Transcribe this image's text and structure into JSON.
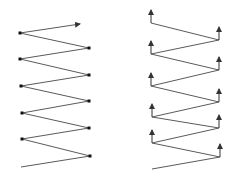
{
  "diagram": {
    "colors": {
      "line": "#5a5a5a",
      "point": "#111111",
      "arrow": "#333333",
      "background": "#ffffff"
    },
    "left_zigzag": {
      "description": "zigzag polyline with dot markers at vertices, arrow at top end",
      "points": [
        [
          80,
          24
        ],
        [
          20,
          33
        ],
        [
          89,
          48
        ],
        [
          20,
          59
        ],
        [
          89,
          75
        ],
        [
          21,
          86
        ],
        [
          89,
          101
        ],
        [
          22,
          113
        ],
        [
          89,
          128
        ],
        [
          22,
          139
        ],
        [
          90,
          156
        ],
        [
          21,
          167
        ]
      ],
      "dots": [
        [
          20,
          33
        ],
        [
          89,
          48
        ],
        [
          20,
          59
        ],
        [
          89,
          75
        ],
        [
          21,
          86
        ],
        [
          89,
          101
        ],
        [
          22,
          113
        ],
        [
          89,
          128
        ],
        [
          22,
          139
        ],
        [
          90,
          156
        ]
      ],
      "arrow_tip": [
        80,
        24
      ]
    },
    "right_zigzag": {
      "description": "zigzag polyline with upward arrows at vertices",
      "points": [
        [
          151,
          23
        ],
        [
          219,
          40
        ],
        [
          151,
          54
        ],
        [
          219,
          70
        ],
        [
          151,
          86
        ],
        [
          219,
          102
        ],
        [
          152,
          117
        ],
        [
          219,
          128
        ],
        [
          152,
          143
        ],
        [
          220,
          157
        ],
        [
          152,
          169
        ]
      ],
      "arrow_bases": [
        [
          151,
          23
        ],
        [
          219,
          40
        ],
        [
          151,
          54
        ],
        [
          219,
          70
        ],
        [
          151,
          86
        ],
        [
          219,
          102
        ],
        [
          152,
          117
        ],
        [
          219,
          128
        ],
        [
          152,
          143
        ],
        [
          220,
          157
        ]
      ],
      "arrow_length": 13
    }
  }
}
